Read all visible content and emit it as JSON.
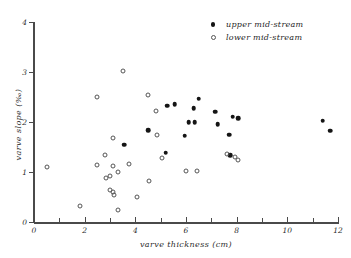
{
  "chart_data": {
    "type": "scatter",
    "title": "",
    "xlabel": "varve thickness (cm)",
    "ylabel": "varve slope (‰)",
    "xlim": [
      0,
      12
    ],
    "ylim": [
      0,
      4
    ],
    "xticks": [
      0,
      2,
      4,
      6,
      8,
      10,
      12
    ],
    "xtick_labels": [
      "0",
      "2",
      "4",
      "6",
      "8",
      "10",
      "12"
    ],
    "x_minor_ticks": [
      1,
      3,
      5,
      7,
      9,
      11
    ],
    "yticks": [
      0,
      1,
      2,
      3,
      4
    ],
    "ytick_labels": [
      "0",
      "1",
      "2",
      "3",
      "4"
    ],
    "grid": false,
    "legend_position": "top-right",
    "series": [
      {
        "name": "upper mid-stream",
        "marker": "filled-circle",
        "color": "#151515",
        "points": [
          [
            3.55,
            1.55
          ],
          [
            4.5,
            1.84
          ],
          [
            5.2,
            1.39
          ],
          [
            5.25,
            2.33
          ],
          [
            5.55,
            2.36
          ],
          [
            5.95,
            1.73
          ],
          [
            6.1,
            2.0
          ],
          [
            6.35,
            2.0
          ],
          [
            6.3,
            2.28
          ],
          [
            6.5,
            2.47
          ],
          [
            7.15,
            2.21
          ],
          [
            7.25,
            1.96
          ],
          [
            7.7,
            1.75
          ],
          [
            7.75,
            1.34
          ],
          [
            7.85,
            2.11
          ],
          [
            8.05,
            2.08
          ],
          [
            11.4,
            2.03
          ],
          [
            11.7,
            1.83
          ]
        ]
      },
      {
        "name": "lower mid-stream",
        "marker": "open-circle",
        "color": "#555555",
        "points": [
          [
            0.5,
            1.11
          ],
          [
            1.8,
            0.33
          ],
          [
            2.5,
            2.5
          ],
          [
            2.5,
            1.14
          ],
          [
            2.8,
            1.34
          ],
          [
            2.85,
            0.89
          ],
          [
            3.0,
            0.92
          ],
          [
            3.0,
            0.64
          ],
          [
            3.1,
            1.68
          ],
          [
            3.1,
            1.12
          ],
          [
            3.12,
            0.6
          ],
          [
            3.15,
            0.55
          ],
          [
            3.3,
            1.0
          ],
          [
            3.3,
            0.25
          ],
          [
            3.52,
            3.02
          ],
          [
            3.75,
            1.16
          ],
          [
            4.05,
            0.51
          ],
          [
            4.5,
            2.54
          ],
          [
            4.55,
            0.83
          ],
          [
            4.8,
            2.22
          ],
          [
            4.85,
            1.75
          ],
          [
            5.05,
            1.28
          ],
          [
            6.0,
            1.03
          ],
          [
            6.45,
            1.02
          ],
          [
            7.6,
            1.37
          ],
          [
            7.95,
            1.31
          ],
          [
            8.05,
            1.25
          ]
        ]
      }
    ]
  },
  "legend": {
    "entries": [
      {
        "label": "upper mid-stream",
        "marker": "filled-circle"
      },
      {
        "label": "lower mid-stream",
        "marker": "open-circle"
      }
    ]
  },
  "colors": {
    "axis": "#4a4a4a",
    "text": "#2b2b2b",
    "filled_marker": "#151515",
    "open_marker": "#555555",
    "background": "#ffffff"
  }
}
